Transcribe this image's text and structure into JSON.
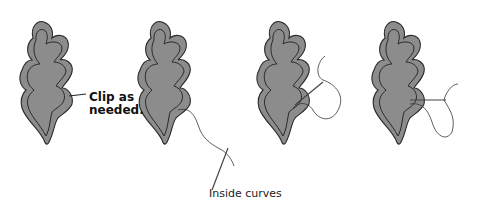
{
  "diagram": {
    "type": "illustration",
    "colors": {
      "leaf_fill": "#8c8c8c",
      "outline": "#2a2a2a",
      "thread": "#333333",
      "background": "#ffffff"
    },
    "steps": [
      {
        "index": 1,
        "label": "Clip as needed."
      },
      {
        "index": 2,
        "label": "Inside curves"
      },
      {
        "index": 3,
        "label": ""
      },
      {
        "index": 4,
        "label": ""
      }
    ]
  }
}
